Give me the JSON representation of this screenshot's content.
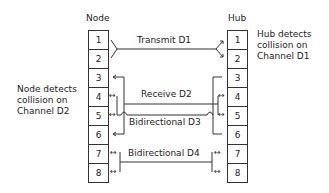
{
  "diagram": {
    "node": {
      "title": "Node",
      "pins": [
        "1",
        "2",
        "3",
        "4",
        "5",
        "6",
        "7",
        "8"
      ],
      "annotation": [
        "Node detects",
        "collision on",
        "Channel D2"
      ]
    },
    "hub": {
      "title": "Hub",
      "pins": [
        "1",
        "2",
        "3",
        "4",
        "5",
        "6",
        "7",
        "8"
      ],
      "annotation": [
        "Hub detects",
        "collision on",
        "Channel D1"
      ]
    },
    "channels": [
      {
        "label": "Transmit D1",
        "node_pins": "1-2",
        "hub_pins": "1-2",
        "direction": "node-to-hub"
      },
      {
        "label": "Receive D2",
        "node_pins": "3-6",
        "hub_pins": "4-5",
        "direction": "hub-to-node"
      },
      {
        "label": "Bidirectional D3",
        "node_pins": "4-5",
        "hub_pins": "3-6",
        "direction": "bidirectional"
      },
      {
        "label": "Bidirectional D4",
        "node_pins": "7-8",
        "hub_pins": "7-8",
        "direction": "bidirectional"
      }
    ],
    "arrow_glyphs": {
      "left": "←",
      "both": "↔"
    }
  }
}
